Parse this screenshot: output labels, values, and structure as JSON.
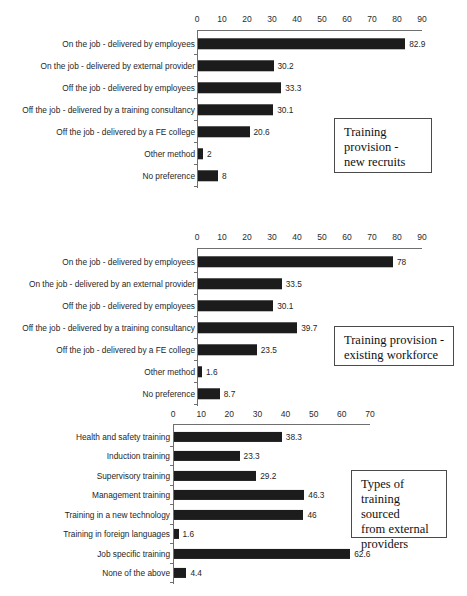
{
  "chart_data": [
    {
      "type": "bar",
      "orientation": "horizontal",
      "title": "Training provision - new recruits",
      "xlabel": "",
      "ylabel": "",
      "xlim": [
        0,
        90
      ],
      "xticks": [
        0,
        10,
        20,
        30,
        40,
        50,
        60,
        70,
        80,
        90
      ],
      "grid": false,
      "legend": "none",
      "categories": [
        "On the job - delivered by employees",
        "On the job - delivered by external provider",
        "Off the job - delivered by employees",
        "Off the job - delivered by a training consultancy",
        "Off the job - delivered by a FE college",
        "Other method",
        "No preference"
      ],
      "values": [
        82.9,
        30.2,
        33.3,
        30.1,
        20.6,
        2,
        8
      ],
      "value_labels": [
        "82.9",
        "30.2",
        "33.3",
        "30.1",
        "20.6",
        "2",
        "8"
      ]
    },
    {
      "type": "bar",
      "orientation": "horizontal",
      "title": "Training provision - existing workforce",
      "xlabel": "",
      "ylabel": "",
      "xlim": [
        0,
        90
      ],
      "xticks": [
        0,
        10,
        20,
        30,
        40,
        50,
        60,
        70,
        80,
        90
      ],
      "grid": false,
      "legend": "none",
      "categories": [
        "On the job - delivered by employees",
        "On the job - delivered by an external provider",
        "Off the job - delivered by employees",
        "Off the job - delivered by a training consultancy",
        "Off the job - delivered by a FE college",
        "Other method",
        "No preference"
      ],
      "values": [
        78,
        33.5,
        30.1,
        39.7,
        23.5,
        1.6,
        8.7
      ],
      "value_labels": [
        "78",
        "33.5",
        "30.1",
        "39.7",
        "23.5",
        "1.6",
        "8.7"
      ]
    },
    {
      "type": "bar",
      "orientation": "horizontal",
      "title": "Types of training sourced from external providers",
      "xlabel": "",
      "ylabel": "",
      "xlim": [
        0,
        70
      ],
      "xticks": [
        0,
        10,
        20,
        30,
        40,
        50,
        60,
        70
      ],
      "grid": false,
      "legend": "none",
      "categories": [
        "Health and safety training",
        "Induction training",
        "Supervisory training",
        "Management training",
        "Training in a new technology",
        "Training in foreign languages",
        "Job specific training",
        "None of the above"
      ],
      "values": [
        38.3,
        23.3,
        29.2,
        46.3,
        46,
        1.6,
        62.6,
        4.4
      ],
      "value_labels": [
        "38.3",
        "23.3",
        "29.2",
        "46.3",
        "46",
        "1.6",
        "62.6",
        "4.4"
      ]
    }
  ],
  "captions": [
    {
      "lines": [
        "Training",
        "provision -",
        "new recruits"
      ]
    },
    {
      "lines": [
        "Training provision -",
        "existing workforce"
      ]
    },
    {
      "lines": [
        "Types of",
        "training sourced",
        "from external",
        "providers"
      ]
    }
  ],
  "colors": {
    "bar": "#1c1c1c",
    "axis": "#6f6f6f",
    "text": "#262626",
    "caption_border": "#4a4a4a",
    "background": "#ffffff"
  }
}
